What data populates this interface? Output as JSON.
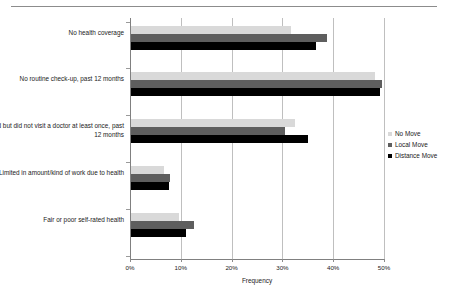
{
  "chart_data": {
    "type": "bar",
    "orientation": "horizontal",
    "title": "",
    "xlabel": "Frequency",
    "ylabel": "",
    "xlim": [
      0,
      50
    ],
    "xticks": [
      "0%",
      "10%",
      "20%",
      "30%",
      "40%",
      "50%"
    ],
    "xtick_values": [
      0,
      10,
      20,
      30,
      40,
      50
    ],
    "grid": "vertical",
    "legend_position": "right",
    "categories": [
      "No health coverage",
      "No routine check-up, past 12 months",
      "Ill/injured but did not visit a doctor at least once, past 12 months",
      "Limited in amount/kind of work due to health",
      "Fair or poor self-rated health"
    ],
    "series": [
      {
        "name": "No Move",
        "color": "#d9d9d9",
        "values": [
          31.5,
          48.0,
          32.3,
          6.5,
          9.5
        ]
      },
      {
        "name": "Local Move",
        "color": "#5e5e5e",
        "values": [
          38.5,
          49.4,
          30.3,
          7.7,
          12.4
        ]
      },
      {
        "name": "Distance Move",
        "color": "#000000",
        "values": [
          36.5,
          49.0,
          34.8,
          7.5,
          10.8
        ]
      }
    ]
  },
  "axis": {
    "x_title": "Frequency"
  },
  "legend": {
    "entries": [
      {
        "label": "No Move",
        "color": "#d9d9d9"
      },
      {
        "label": "Local Move",
        "color": "#5e5e5e"
      },
      {
        "label": "Distance Move",
        "color": "#000000"
      }
    ]
  }
}
